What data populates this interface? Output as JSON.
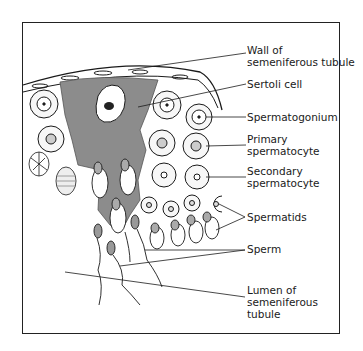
{
  "diagram": {
    "labels": [
      {
        "id": "wall",
        "line1": "Wall of",
        "line2": "semeniferous tubule"
      },
      {
        "id": "sertoli",
        "line1": "Sertoli cell"
      },
      {
        "id": "spermatogonium",
        "line1": "Spermatogonium"
      },
      {
        "id": "primary",
        "line1": "Primary",
        "line2": "spermatocyte"
      },
      {
        "id": "secondary",
        "line1": "Secondary",
        "line2": "spermatocyte"
      },
      {
        "id": "spermatids",
        "line1": "Spermatids"
      },
      {
        "id": "sperm",
        "line1": "Sperm"
      },
      {
        "id": "lumen",
        "line1": "Lumen of",
        "line2": "semeniferous",
        "line3": "tubule"
      }
    ],
    "colors": {
      "sertoli_fill": "#8c8c8c",
      "line": "#1a1a1a",
      "background": "#ffffff"
    }
  }
}
